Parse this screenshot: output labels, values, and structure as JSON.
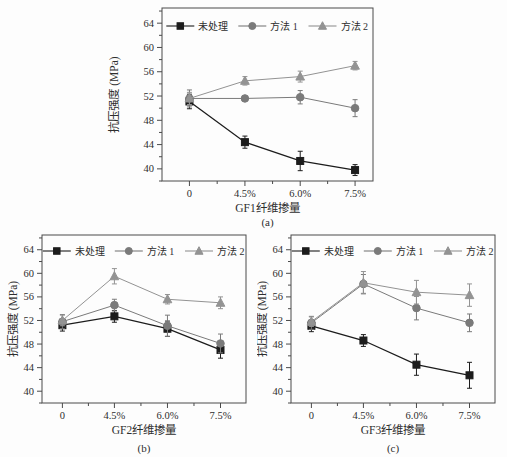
{
  "figure": {
    "background": "#fdfdfd",
    "frame_color": "#4a4a4a",
    "text_color": "#2e2e2e",
    "legend": {
      "position": "top-center-inside",
      "items": [
        {
          "label": "未处理",
          "marker": "square",
          "color": "#1c1c1c"
        },
        {
          "label": "方法 1",
          "marker": "circle",
          "color": "#7a7a7a"
        },
        {
          "label": "方法 2",
          "marker": "triangle",
          "color": "#939393"
        }
      ]
    }
  },
  "chart_data": [
    {
      "id": "a",
      "type": "line",
      "caption": "(a)",
      "xlabel": "GF1纤维掺量",
      "ylabel": "抗压强度 (MPa)",
      "categories": [
        "0",
        "4.5%",
        "6.0%",
        "7.5%"
      ],
      "yticks": [
        40,
        44,
        48,
        52,
        56,
        60,
        64
      ],
      "yminor": [
        38,
        42,
        46,
        50,
        54,
        58,
        62,
        66
      ],
      "ylim": [
        38,
        66.5
      ],
      "grid": false,
      "legend_labels": [
        "未处理",
        "方法 1",
        "方法 2"
      ],
      "series": [
        {
          "name": "未处理",
          "marker": "square",
          "color": "#1c1c1c",
          "values": [
            51.1,
            44.4,
            41.3,
            39.8
          ],
          "errors": [
            1.2,
            1.0,
            1.6,
            0.9
          ]
        },
        {
          "name": "方法 1",
          "marker": "circle",
          "color": "#7a7a7a",
          "values": [
            51.6,
            51.6,
            51.8,
            50.0
          ],
          "errors": [
            1.4,
            0.3,
            1.1,
            1.4
          ]
        },
        {
          "name": "方法 2",
          "marker": "triangle",
          "color": "#939393",
          "values": [
            51.6,
            54.5,
            55.2,
            57.0
          ],
          "errors": [
            1.0,
            0.7,
            0.9,
            0.7
          ]
        }
      ]
    },
    {
      "id": "b",
      "type": "line",
      "caption": "(b)",
      "xlabel": "GF2纤维掺量",
      "ylabel": "抗压强度 (MPa)",
      "categories": [
        "0",
        "4.5%",
        "6.0%",
        "7.5%"
      ],
      "yticks": [
        40,
        44,
        48,
        52,
        56,
        60,
        64
      ],
      "yminor": [
        38,
        42,
        46,
        50,
        54,
        58,
        62,
        66
      ],
      "ylim": [
        38,
        66.5
      ],
      "grid": false,
      "legend_labels": [
        "未处理",
        "方法 1",
        "方法 2"
      ],
      "series": [
        {
          "name": "未处理",
          "marker": "square",
          "color": "#1c1c1c",
          "values": [
            51.2,
            52.7,
            50.6,
            47.0
          ],
          "errors": [
            1.0,
            1.0,
            1.3,
            1.4
          ]
        },
        {
          "name": "方法 1",
          "marker": "circle",
          "color": "#7a7a7a",
          "values": [
            51.8,
            54.6,
            51.1,
            48.1
          ],
          "errors": [
            1.2,
            1.0,
            1.8,
            1.6
          ]
        },
        {
          "name": "方法 2",
          "marker": "triangle",
          "color": "#939393",
          "values": [
            52.0,
            59.5,
            55.6,
            55.0
          ],
          "errors": [
            0.9,
            1.3,
            0.8,
            1.0
          ]
        }
      ]
    },
    {
      "id": "c",
      "type": "line",
      "caption": "(c)",
      "xlabel": "GF3纤维掺量",
      "ylabel": "抗压强度 (MPa)",
      "categories": [
        "0",
        "4.5%",
        "6.0%",
        "7.5%"
      ],
      "yticks": [
        40,
        44,
        48,
        52,
        56,
        60,
        64
      ],
      "yminor": [
        38,
        42,
        46,
        50,
        54,
        58,
        62,
        66
      ],
      "ylim": [
        38,
        66.5
      ],
      "grid": false,
      "legend_labels": [
        "未处理",
        "方法 1",
        "方法 2"
      ],
      "series": [
        {
          "name": "未处理",
          "marker": "square",
          "color": "#1c1c1c",
          "values": [
            51.1,
            48.6,
            44.5,
            42.7
          ],
          "errors": [
            1.0,
            1.0,
            1.8,
            2.2
          ]
        },
        {
          "name": "方法 1",
          "marker": "circle",
          "color": "#7a7a7a",
          "values": [
            51.6,
            58.2,
            54.1,
            51.6
          ],
          "errors": [
            1.1,
            1.6,
            2.0,
            1.5
          ]
        },
        {
          "name": "方法 2",
          "marker": "triangle",
          "color": "#939393",
          "values": [
            51.8,
            58.4,
            56.8,
            56.3
          ],
          "errors": [
            0.8,
            1.9,
            2.0,
            1.9
          ]
        }
      ]
    }
  ]
}
